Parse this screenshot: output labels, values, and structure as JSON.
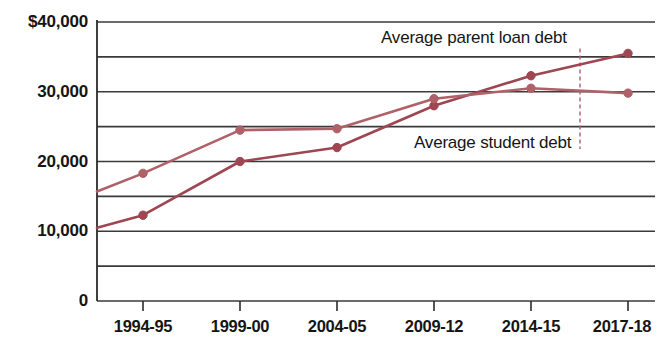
{
  "chart_data": {
    "type": "line",
    "title": "",
    "subtitle": "",
    "xlabel": "",
    "ylabel": "",
    "categories": [
      "1994-95",
      "1999-00",
      "2004-05",
      "2009-12",
      "2014-15",
      "2017-18"
    ],
    "ylim": [
      0,
      40000
    ],
    "ytick_values": [
      0,
      5000,
      10000,
      15000,
      20000,
      25000,
      30000,
      35000,
      40000
    ],
    "ytick_labels": [
      "0",
      "",
      "10,000",
      "",
      "20,000",
      "",
      "30,000",
      "",
      "$40,000"
    ],
    "ytick_labels_shown": [
      "$40,000",
      "30,000",
      "20,000",
      "10,000",
      "0"
    ],
    "grid": true,
    "grid_axis": "y",
    "legend": "inline-annotations",
    "series": [
      {
        "name": "Average parent loan debt",
        "color": "#9e4651",
        "values": [
          12300,
          20000,
          22000,
          28000,
          32300,
          35500
        ],
        "left_edge_value": 10500
      },
      {
        "name": "Average student debt",
        "color": "#b06068",
        "values": [
          18300,
          24500,
          24700,
          29000,
          30500,
          29800
        ],
        "left_edge_value": 15700
      }
    ],
    "annotations": [
      {
        "text": "Average parent loan debt",
        "value": 37500
      },
      {
        "text": "Average student debt",
        "value": 22500
      }
    ],
    "leader_line": {
      "style": "dashed",
      "color": "#b06068"
    }
  },
  "colors": {
    "axis": "#2b2b2b",
    "grid": "#3a3a3a",
    "series_parent": "#9e4651",
    "series_student": "#b06068",
    "text": "#151515",
    "background": "#ffffff"
  }
}
